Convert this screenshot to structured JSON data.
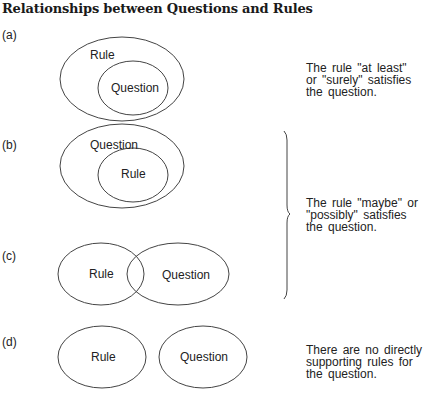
{
  "title": "Relationships between Questions and Rules",
  "panels": [
    {
      "label": "(a)",
      "outer": "Rule",
      "inner": "Question",
      "relation": "question-subset-of-rule",
      "description": [
        "The rule \"at least\"",
        "or \"surely\" satisfies",
        "the question."
      ]
    },
    {
      "label": "(b)",
      "outer": "Question",
      "inner": "Rule",
      "relation": "rule-subset-of-question"
    },
    {
      "label": "(c)",
      "left": "Rule",
      "right": "Question",
      "relation": "overlapping"
    },
    {
      "label": "(d)",
      "left": "Rule",
      "right": "Question",
      "relation": "disjoint",
      "description": [
        "There are no directly",
        "supporting rules for",
        "the question."
      ]
    }
  ],
  "brace_description": [
    "The rule \"maybe\" or",
    "\"possibly\" satisfies",
    "the question."
  ],
  "colors": {
    "stroke": "#444444",
    "text": "#222222"
  }
}
